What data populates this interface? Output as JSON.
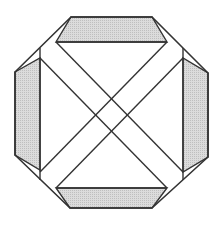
{
  "figure": {
    "width": 219,
    "height": 226,
    "colors": {
      "stroke": "#333333",
      "band_fill": "#d9d9d9",
      "band_pattern": "#bdbdbd",
      "tint": "#e8dce6",
      "background": "#ffffff"
    },
    "octagon": [
      [
        71,
        17
      ],
      [
        152,
        17
      ],
      [
        208,
        73
      ],
      [
        208,
        157
      ],
      [
        152,
        208
      ],
      [
        70,
        208
      ],
      [
        15,
        155
      ],
      [
        15,
        72
      ]
    ],
    "bands": {
      "top": [
        [
          71,
          17
        ],
        [
          152,
          17
        ],
        [
          167,
          42
        ],
        [
          56,
          42
        ]
      ],
      "right": [
        [
          208,
          73
        ],
        [
          208,
          157
        ],
        [
          183,
          172
        ],
        [
          183,
          58
        ]
      ],
      "bottom": [
        [
          70,
          208
        ],
        [
          152,
          208
        ],
        [
          167,
          188
        ],
        [
          56,
          188
        ]
      ],
      "left": [
        [
          15,
          72
        ],
        [
          40,
          58
        ],
        [
          40,
          170
        ],
        [
          15,
          155
        ]
      ]
    },
    "inner_lines": {
      "top": [
        [
          56,
          42
        ],
        [
          167,
          42
        ]
      ],
      "bottom": [
        [
          56,
          188
        ],
        [
          167,
          188
        ]
      ],
      "left": [
        [
          40,
          48
        ],
        [
          40,
          180
        ]
      ],
      "right": [
        [
          183,
          48
        ],
        [
          183,
          180
        ]
      ]
    },
    "diagonals": [
      [
        [
          56,
          42
        ],
        [
          183,
          172
        ]
      ],
      [
        [
          40,
          58
        ],
        [
          167,
          188
        ]
      ],
      [
        [
          167,
          42
        ],
        [
          40,
          172
        ]
      ],
      [
        [
          183,
          58
        ],
        [
          56,
          188
        ]
      ]
    ]
  }
}
